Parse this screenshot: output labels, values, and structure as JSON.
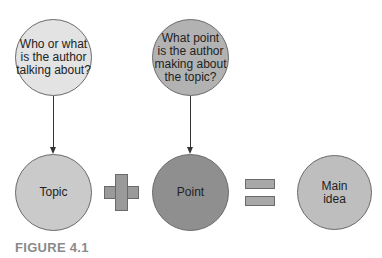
{
  "diagram": {
    "question_nodes": [
      {
        "id": "who-what",
        "text": "Who or what\nis the author\ntalking about?",
        "fill": "#e3e3e3"
      },
      {
        "id": "what-point",
        "text": "What point\nis the author\nmaking about\nthe topic?",
        "fill": "#b2b2b2"
      }
    ],
    "equation_nodes": [
      {
        "id": "topic",
        "text": "Topic",
        "fill": "#cacaca"
      },
      {
        "id": "point",
        "text": "Point",
        "fill": "#8f8f8f"
      },
      {
        "id": "main-idea",
        "text": "Main\nidea",
        "fill": "#bebebe"
      }
    ],
    "operators": {
      "plus": "+",
      "equals": "="
    },
    "edges": [
      {
        "from": "who-what",
        "to": "topic"
      },
      {
        "from": "what-point",
        "to": "point"
      }
    ],
    "caption": "FIGURE 4.1"
  }
}
